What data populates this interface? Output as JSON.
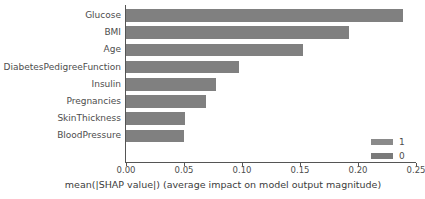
{
  "chart_data": {
    "type": "bar",
    "orientation": "horizontal",
    "title": "",
    "xlabel": "mean(|SHAP value|) (average impact on model output magnitude)",
    "ylabel": "",
    "categories": [
      "Glucose",
      "BMI",
      "Age",
      "DiabetesPedigreeFunction",
      "Insulin",
      "Pregnancies",
      "SkinThickness",
      "BloodPressure"
    ],
    "values": [
      0.239,
      0.192,
      0.153,
      0.097,
      0.078,
      0.069,
      0.051,
      0.05
    ],
    "xlim": [
      0.0,
      0.25
    ],
    "xticks": [
      0.0,
      0.05,
      0.1,
      0.15,
      0.2,
      0.25
    ],
    "xticklabels": [
      "0.00",
      "0.05",
      "0.10",
      "0.15",
      "0.20",
      "0.25"
    ],
    "grid": false,
    "legend_position": "lower-right",
    "series": [
      {
        "name": "1",
        "color": "#808080"
      },
      {
        "name": "0",
        "color": "#7a7a7a"
      }
    ],
    "bar_color": "#808080"
  },
  "legend": {
    "items": [
      {
        "label": "1",
        "color": "#8a8a8a"
      },
      {
        "label": "0",
        "color": "#7a7a7a"
      }
    ]
  },
  "axis": {
    "spine_color": "#555555",
    "tick_label_color": "#4d4d4d",
    "title_color": "#3c3c3c"
  }
}
